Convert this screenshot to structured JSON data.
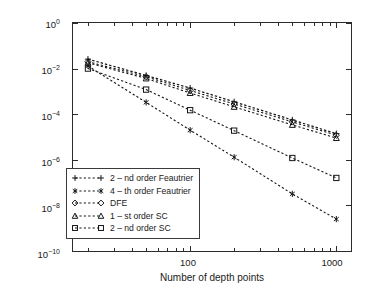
{
  "chart_data": {
    "type": "line",
    "title": "",
    "xlabel": "Number of depth points",
    "ylabel": "Maximum absolute error",
    "xscale": "log",
    "yscale": "log",
    "xlim": [
      15.8,
      1260
    ],
    "ylim": [
      1e-10,
      1
    ],
    "grid": false,
    "legend_position": "lower left",
    "x_ticklabels": [
      "100",
      "1000"
    ],
    "x_tickvalues": [
      100,
      1000
    ],
    "y_ticklabels": [
      "10⁻¹⁰",
      "10⁻⁸",
      "10⁻⁶",
      "10⁻⁴",
      "10⁻²",
      "10⁰"
    ],
    "y_tickvalues": [
      1e-10,
      1e-08,
      1e-06,
      0.0001,
      0.01,
      1
    ],
    "series": [
      {
        "name": "2 – nd order Feautrier",
        "marker": "plus",
        "linestyle": "dashed",
        "x": [
          20,
          50,
          100,
          200,
          500,
          1000
        ],
        "y": [
          0.026,
          0.005,
          0.0014,
          0.00035,
          5.6e-05,
          1.4e-05
        ]
      },
      {
        "name": "4 – th order Feautrier",
        "marker": "asterisk",
        "linestyle": "dashed",
        "x": [
          20,
          50,
          100,
          200,
          500,
          1000
        ],
        "y": [
          0.013,
          0.00033,
          2e-05,
          1.3e-06,
          3.2e-08,
          2.5e-09
        ]
      },
      {
        "name": "DFE",
        "marker": "diamond",
        "linestyle": "dashed",
        "x": [
          20,
          50,
          100,
          200,
          500,
          1000
        ],
        "y": [
          0.02,
          0.0044,
          0.0011,
          0.00028,
          4.6e-05,
          1.2e-05
        ]
      },
      {
        "name": "1 – st order SC",
        "marker": "triangle",
        "linestyle": "dashed",
        "x": [
          20,
          50,
          100,
          200,
          500,
          1000
        ],
        "y": [
          0.018,
          0.0037,
          0.00085,
          0.00021,
          3.4e-05,
          9e-06
        ]
      },
      {
        "name": "2 – nd order SC",
        "marker": "square",
        "linestyle": "dashed",
        "x": [
          20,
          50,
          100,
          200,
          500,
          1000
        ],
        "y": [
          0.01,
          0.0012,
          0.00015,
          1.9e-05,
          1.2e-06,
          1.6e-07
        ]
      }
    ]
  },
  "axes": {
    "x_title": "Number of depth points",
    "y_title": "Maximum absolute error",
    "x_tick_1": "100",
    "x_tick_2": "1000",
    "y_tick_0": "10",
    "y_tick_0_exp": "0",
    "y_tick_1": "10",
    "y_tick_1_exp": "−2",
    "y_tick_2": "10",
    "y_tick_2_exp": "−4",
    "y_tick_3": "10",
    "y_tick_3_exp": "−6",
    "y_tick_4": "10",
    "y_tick_4_exp": "−8",
    "y_tick_5": "10",
    "y_tick_5_exp": "−10"
  },
  "legend": {
    "entries": [
      {
        "label": "2 – nd order Feautrier",
        "marker": "plus"
      },
      {
        "label": "4 – th order Feautrier",
        "marker": "asterisk"
      },
      {
        "label": "DFE",
        "marker": "diamond"
      },
      {
        "label": "1 – st order SC",
        "marker": "triangle"
      },
      {
        "label": "2 – nd order SC",
        "marker": "square"
      }
    ]
  },
  "colors": {
    "ink": "#1a1a1a",
    "axis": "#2b2b2b",
    "background": "#ffffff"
  }
}
